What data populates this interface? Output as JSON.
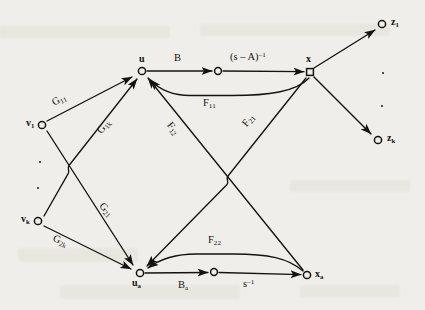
{
  "figure": {
    "type": "signal-flow-graph",
    "background_color": "#f0eeea",
    "ink_color": "#15130f",
    "width": 425,
    "height": 310
  },
  "nodes": [
    {
      "id": "v1",
      "label": "v",
      "sub": "1",
      "shape": "circle",
      "x": 42,
      "y": 125,
      "label_pos": "left"
    },
    {
      "id": "vk",
      "label": "v",
      "sub": "k",
      "shape": "circle",
      "x": 38,
      "y": 221,
      "label_pos": "left"
    },
    {
      "id": "u",
      "label": "u",
      "sub": "",
      "shape": "circle",
      "x": 142,
      "y": 71,
      "label_pos": "top"
    },
    {
      "id": "ua",
      "label": "u",
      "sub": "a",
      "shape": "circle",
      "x": 140,
      "y": 273,
      "label_pos": "bottom"
    },
    {
      "id": "m1",
      "label": "",
      "sub": "",
      "shape": "circle",
      "x": 218,
      "y": 71,
      "label_pos": "none"
    },
    {
      "id": "m2",
      "label": "",
      "sub": "",
      "shape": "circle",
      "x": 214,
      "y": 272,
      "label_pos": "none"
    },
    {
      "id": "x",
      "label": "x",
      "sub": "",
      "shape": "square",
      "x": 310,
      "y": 72,
      "label_pos": "top"
    },
    {
      "id": "xa",
      "label": "x",
      "sub": "a",
      "shape": "circle",
      "x": 307,
      "y": 275,
      "label_pos": "right"
    },
    {
      "id": "z1",
      "label": "z",
      "sub": "1",
      "shape": "circle",
      "x": 382,
      "y": 24,
      "label_pos": "right"
    },
    {
      "id": "zk",
      "label": "z",
      "sub": "k",
      "shape": "circle",
      "x": 378,
      "y": 140,
      "label_pos": "right"
    }
  ],
  "edges": [
    {
      "id": "e-v1-u",
      "from": "v1",
      "to": "u",
      "label": "G",
      "sub": "11",
      "sup": ""
    },
    {
      "id": "e-v1-ua",
      "from": "v1",
      "to": "ua",
      "label": "G",
      "sub": "21",
      "sup": ""
    },
    {
      "id": "e-vk-u",
      "from": "vk",
      "to": "u",
      "label": "G",
      "sub": "1k",
      "sup": ""
    },
    {
      "id": "e-vk-ua",
      "from": "vk",
      "to": "ua",
      "label": "G",
      "sub": "2k",
      "sup": ""
    },
    {
      "id": "e-u-m1",
      "from": "u",
      "to": "m1",
      "label": "B",
      "sub": "",
      "sup": ""
    },
    {
      "id": "e-m1-x",
      "from": "m1",
      "to": "x",
      "label": "(s – A)",
      "sub": "",
      "sup": "–1"
    },
    {
      "id": "e-x-u",
      "from": "x",
      "to": "u",
      "label": "F",
      "sub": "11",
      "sup": ""
    },
    {
      "id": "e-x-ua",
      "from": "x",
      "to": "ua",
      "label": "F",
      "sub": "12",
      "sup": ""
    },
    {
      "id": "e-xa-u",
      "from": "xa",
      "to": "u",
      "label": "F",
      "sub": "21",
      "sup": ""
    },
    {
      "id": "e-xa-ua",
      "from": "xa",
      "to": "ua",
      "label": "F",
      "sub": "22",
      "sup": ""
    },
    {
      "id": "e-ua-m2",
      "from": "ua",
      "to": "m2",
      "label": "B",
      "sub": "a",
      "sup": ""
    },
    {
      "id": "e-m2-xa",
      "from": "m2",
      "to": "xa",
      "label": "s",
      "sub": "",
      "sup": "–1"
    },
    {
      "id": "e-x-z1",
      "from": "x",
      "to": "z1",
      "label": "",
      "sub": "",
      "sup": ""
    },
    {
      "id": "e-x-zk",
      "from": "x",
      "to": "zk",
      "label": "",
      "sub": "",
      "sup": ""
    }
  ],
  "edge_labels": {
    "G11": {
      "text": "G",
      "sub": "11",
      "sup": "",
      "x": 58,
      "y": 108
    },
    "G1k": {
      "text": "G",
      "sub": "1k",
      "sup": "",
      "x": 105,
      "y": 135
    },
    "G21": {
      "text": "G",
      "sub": "21",
      "sup": "",
      "x": 104,
      "y": 208
    },
    "G2k": {
      "text": "G",
      "sub": "2k",
      "sup": "",
      "x": 58,
      "y": 240
    },
    "B": {
      "text": "B",
      "sub": "",
      "sup": "",
      "x": 178,
      "y": 61
    },
    "sA": {
      "text": "(s – A)",
      "sub": "",
      "sup": "–1",
      "x": 232,
      "y": 58
    },
    "F11": {
      "text": "F",
      "sub": "11",
      "sup": "",
      "x": 210,
      "y": 100
    },
    "F12": {
      "text": "F",
      "sub": "12",
      "sup": "",
      "x": 172,
      "y": 125
    },
    "F21": {
      "text": "F",
      "sub": "21",
      "sup": "",
      "x": 249,
      "y": 125
    },
    "F22": {
      "text": "F",
      "sub": "22",
      "sup": "",
      "x": 215,
      "y": 238
    },
    "Ba": {
      "text": "B",
      "sub": "a",
      "sup": "",
      "x": 185,
      "y": 285
    },
    "sinv": {
      "text": "s",
      "sub": "",
      "sup": "–1",
      "x": 248,
      "y": 285
    }
  },
  "ellipsis_dots": [
    {
      "id": "dots-v-1",
      "x": 39,
      "y": 161
    },
    {
      "id": "dots-v-2",
      "x": 38,
      "y": 187
    },
    {
      "id": "dots-z-1",
      "x": 382,
      "y": 72
    },
    {
      "id": "dots-z-2",
      "x": 381,
      "y": 105
    }
  ]
}
